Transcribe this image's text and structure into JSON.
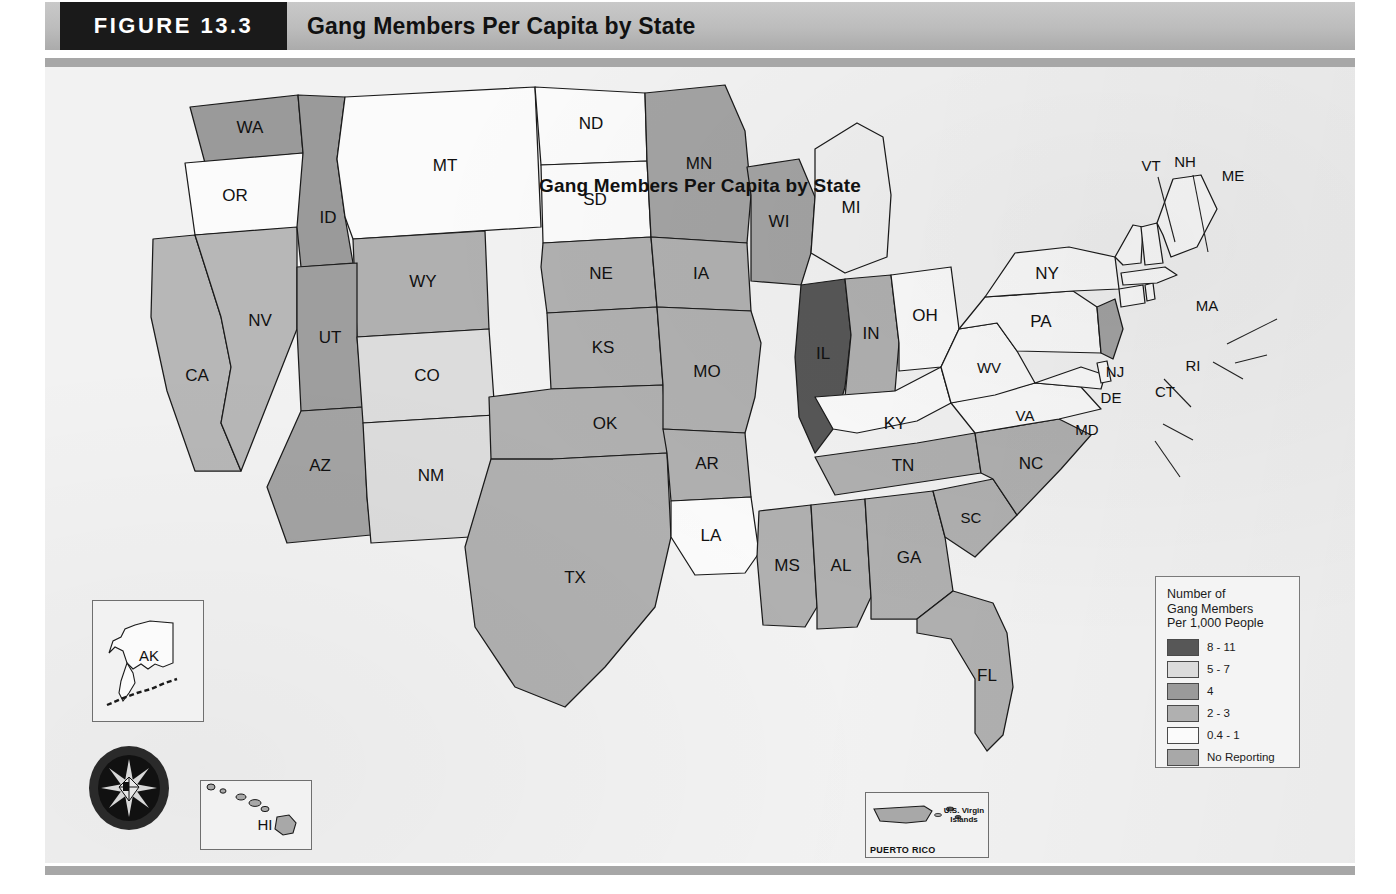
{
  "header": {
    "figure_number": "FIGURE 13.3",
    "figure_title": "Gang Members Per Capita by State"
  },
  "map": {
    "title": "Gang Members Per Capita by State",
    "source_seal": "NATIONAL DRUG INTELLIGENCE CENTER"
  },
  "legend": {
    "title_line1": "Number of",
    "title_line2": "Gang Members",
    "title_line3": "Per 1,000 People",
    "items": [
      {
        "label": "8 - 11",
        "color": "#575757"
      },
      {
        "label": "5 - 7",
        "color": "#dcdcdc"
      },
      {
        "label": "4",
        "color": "#9a9a9a"
      },
      {
        "label": "2 - 3",
        "color": "#b0b0b0"
      },
      {
        "label": "0.4 - 1",
        "color": "#fbfbfb"
      },
      {
        "label": "No Reporting",
        "color": "#a8a8a8"
      }
    ]
  },
  "insets": {
    "alaska_label": "AK",
    "hawaii_label": "HI",
    "puerto_rico_label": "PUERTO RICO",
    "virgin_islands_label": "U.S. Virgin Islands"
  },
  "chart_data": {
    "type": "choropleth",
    "title": "Gang Members Per Capita by State",
    "unit": "Number of Gang Members Per 1,000 People",
    "bins": [
      "8 - 11",
      "5 - 7",
      "4",
      "2 - 3",
      "0.4 - 1",
      "No Reporting"
    ],
    "bin_colors": [
      "#575757",
      "#dcdcdc",
      "#9a9a9a",
      "#b0b0b0",
      "#fbfbfb",
      "#a8a8a8"
    ],
    "states": [
      {
        "code": "WA",
        "bin": "4",
        "color": "#9a9a9a"
      },
      {
        "code": "OR",
        "bin": "0.4 - 1",
        "color": "#fbfbfb"
      },
      {
        "code": "CA",
        "bin": "2 - 3",
        "color": "#b7b7b7"
      },
      {
        "code": "NV",
        "bin": "2 - 3",
        "color": "#b7b7b7"
      },
      {
        "code": "ID",
        "bin": "4",
        "color": "#9a9a9a"
      },
      {
        "code": "MT",
        "bin": "0.4 - 1",
        "color": "#fbfbfb"
      },
      {
        "code": "WY",
        "bin": "2 - 3",
        "color": "#b0b0b0"
      },
      {
        "code": "UT",
        "bin": "4",
        "color": "#9e9e9e"
      },
      {
        "code": "AZ",
        "bin": "4",
        "color": "#a3a3a3"
      },
      {
        "code": "CO",
        "bin": "5 - 7",
        "color": "#dcdcdc"
      },
      {
        "code": "NM",
        "bin": "5 - 7",
        "color": "#dcdcdc"
      },
      {
        "code": "ND",
        "bin": "0.4 - 1",
        "color": "#fbfbfb"
      },
      {
        "code": "SD",
        "bin": "0.4 - 1",
        "color": "#fbfbfb"
      },
      {
        "code": "NE",
        "bin": "2 - 3",
        "color": "#b0b0b0"
      },
      {
        "code": "KS",
        "bin": "2 - 3",
        "color": "#b0b0b0"
      },
      {
        "code": "OK",
        "bin": "2 - 3",
        "color": "#b0b0b0"
      },
      {
        "code": "TX",
        "bin": "2 - 3",
        "color": "#b0b0b0"
      },
      {
        "code": "MN",
        "bin": "4",
        "color": "#a3a3a3"
      },
      {
        "code": "IA",
        "bin": "2 - 3",
        "color": "#b0b0b0"
      },
      {
        "code": "MO",
        "bin": "2 - 3",
        "color": "#b0b0b0"
      },
      {
        "code": "AR",
        "bin": "2 - 3",
        "color": "#b0b0b0"
      },
      {
        "code": "LA",
        "bin": "0.4 - 1",
        "color": "#fbfbfb"
      },
      {
        "code": "WI",
        "bin": "4",
        "color": "#a3a3a3"
      },
      {
        "code": "IL",
        "bin": "8 - 11",
        "color": "#575757"
      },
      {
        "code": "IN",
        "bin": "2 - 3",
        "color": "#b0b0b0"
      },
      {
        "code": "MI",
        "bin": "0.4 - 1",
        "color": "#f0f0f0"
      },
      {
        "code": "OH",
        "bin": "0.4 - 1",
        "color": "#fbfbfb"
      },
      {
        "code": "KY",
        "bin": "0.4 - 1",
        "color": "#fbfbfb"
      },
      {
        "code": "TN",
        "bin": "2 - 3",
        "color": "#b0b0b0"
      },
      {
        "code": "MS",
        "bin": "2 - 3",
        "color": "#b0b0b0"
      },
      {
        "code": "AL",
        "bin": "2 - 3",
        "color": "#b0b0b0"
      },
      {
        "code": "GA",
        "bin": "2 - 3",
        "color": "#b0b0b0"
      },
      {
        "code": "FL",
        "bin": "2 - 3",
        "color": "#b0b0b0"
      },
      {
        "code": "SC",
        "bin": "2 - 3",
        "color": "#b0b0b0"
      },
      {
        "code": "NC",
        "bin": "2 - 3",
        "color": "#b0b0b0"
      },
      {
        "code": "VA",
        "bin": "0.4 - 1",
        "color": "#fbfbfb"
      },
      {
        "code": "WV",
        "bin": "0.4 - 1",
        "color": "#fbfbfb"
      },
      {
        "code": "MD",
        "bin": "0.4 - 1",
        "color": "#fbfbfb"
      },
      {
        "code": "DE",
        "bin": "0.4 - 1",
        "color": "#fbfbfb"
      },
      {
        "code": "PA",
        "bin": "0.4 - 1",
        "color": "#fbfbfb"
      },
      {
        "code": "NJ",
        "bin": "4",
        "color": "#a3a3a3"
      },
      {
        "code": "NY",
        "bin": "0.4 - 1",
        "color": "#fbfbfb"
      },
      {
        "code": "CT",
        "bin": "0.4 - 1",
        "color": "#fbfbfb"
      },
      {
        "code": "RI",
        "bin": "0.4 - 1",
        "color": "#fbfbfb"
      },
      {
        "code": "MA",
        "bin": "0.4 - 1",
        "color": "#fbfbfb"
      },
      {
        "code": "VT",
        "bin": "0.4 - 1",
        "color": "#fbfbfb"
      },
      {
        "code": "NH",
        "bin": "0.4 - 1",
        "color": "#fbfbfb"
      },
      {
        "code": "ME",
        "bin": "0.4 - 1",
        "color": "#fbfbfb"
      },
      {
        "code": "AK",
        "bin": "0.4 - 1",
        "color": "#fbfbfb"
      },
      {
        "code": "HI",
        "bin": "2 - 3",
        "color": "#b0b0b0"
      },
      {
        "code": "PR",
        "bin": "2 - 3",
        "color": "#b0b0b0"
      }
    ]
  }
}
